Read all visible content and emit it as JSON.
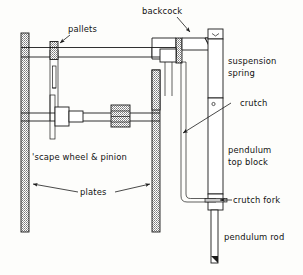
{
  "figure": {
    "background_color": "#fdfdfb",
    "ink_color": "#1a1a1a",
    "hatch_color": "#6e6e6e"
  },
  "labels": {
    "pallets": "pallets",
    "backcock": "backcock",
    "suspension_spring_line1": "suspension",
    "suspension_spring_line2": "spring",
    "crutch": "crutch",
    "pendulum_top_block_line1": "pendulum",
    "pendulum_top_block_line2": "top block",
    "crutch_fork": "crutch fork",
    "pendulum_rod": "pendulum rod",
    "scape_wheel_pinion": "'scape wheel & pinion",
    "plates": "plates"
  },
  "parts": [
    {
      "id": "left-plate",
      "name": "plates",
      "style": "hatched"
    },
    {
      "id": "right-plate",
      "name": "plates",
      "style": "hatched"
    },
    {
      "id": "pallet-block",
      "name": "pallets",
      "style": "hatched"
    },
    {
      "id": "pallet-arbor",
      "name": "pallet arbor",
      "style": "outline"
    },
    {
      "id": "escape-wheel",
      "name": "'scape wheel",
      "style": "outline"
    },
    {
      "id": "pinion",
      "name": "pinion",
      "style": "hatched"
    },
    {
      "id": "backcock",
      "name": "backcock",
      "style": "hatched"
    },
    {
      "id": "suspension-spring",
      "name": "suspension spring",
      "style": "outline"
    },
    {
      "id": "pendulum-top-block",
      "name": "pendulum top block",
      "style": "outline"
    },
    {
      "id": "crutch",
      "name": "crutch",
      "style": "outline"
    },
    {
      "id": "crutch-fork",
      "name": "crutch fork",
      "style": "outline"
    },
    {
      "id": "pendulum-rod",
      "name": "pendulum rod",
      "style": "outline"
    }
  ]
}
